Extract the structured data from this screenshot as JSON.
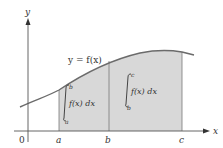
{
  "diagram": {
    "type": "area-under-curve",
    "axes": {
      "x_label": "x",
      "y_label": "y",
      "origin_label": "0"
    },
    "curve_label": "y = f(x)",
    "points": {
      "a": "a",
      "b": "b",
      "c": "c"
    },
    "regions": [
      {
        "from": "a",
        "to": "b",
        "integral": {
          "upper": "b",
          "lower": "a",
          "integrand": "f(x) dx"
        }
      },
      {
        "from": "b",
        "to": "c",
        "integral": {
          "upper": "c",
          "lower": "b",
          "integrand": "f(x) dx"
        }
      }
    ],
    "colors": {
      "shade": "#d8d8d8",
      "curve": "#6b6b6b",
      "axis": "#555555",
      "divider": "#7a7a7a"
    }
  }
}
